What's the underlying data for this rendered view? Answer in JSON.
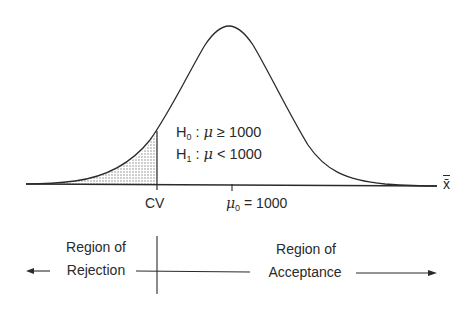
{
  "diagram": {
    "type": "normal-distribution-hypothesis-test",
    "axis_label": "x̄",
    "critical_value_label": "CV",
    "mean_label": {
      "symbol": "μ",
      "subscript": "0",
      "relation": "=",
      "value": "1000"
    },
    "hypotheses": [
      {
        "symbol": "H",
        "subscript": "0",
        "param": "μ",
        "relation": "≥",
        "value": "1000"
      },
      {
        "symbol": "H",
        "subscript": "1",
        "param": "μ",
        "relation": "<",
        "value": "1000"
      }
    ],
    "regions": {
      "rejection": {
        "line1": "Region of",
        "line2": "Rejection",
        "direction": "left"
      },
      "acceptance": {
        "line1": "Region of",
        "line2": "Acceptance",
        "direction": "right"
      }
    },
    "shaded_tail": "left",
    "colors": {
      "ink": "#2a2a2a",
      "shade": "#9a9a9a",
      "background": "#ffffff"
    }
  }
}
